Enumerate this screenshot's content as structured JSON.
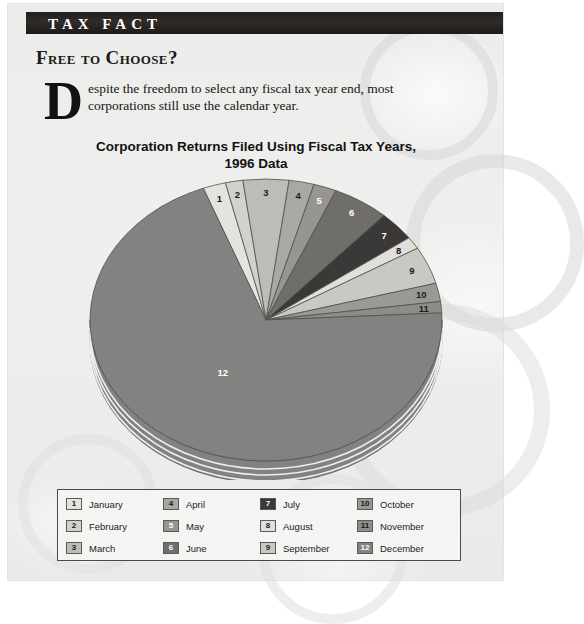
{
  "banner": {
    "title": "TAX FACT"
  },
  "article": {
    "headline": "Free to Choose?",
    "dropcap": "D",
    "body": "espite the freedom to select any fiscal tax year end, most corporations still use the calendar year."
  },
  "chart_data": {
    "type": "pie",
    "title": "Corporation Returns Filed Using Fiscal Tax Years, 1996 Data",
    "title_line1": "Corporation Returns Filed Using Fiscal Tax Years,",
    "title_line2": "1996 Data",
    "xlabel": "",
    "ylabel": "",
    "legend_position": "bottom",
    "grid": false,
    "categories": [
      "January",
      "February",
      "March",
      "April",
      "May",
      "June",
      "July",
      "August",
      "September",
      "October",
      "November",
      "December"
    ],
    "slice_numbers": [
      "1",
      "2",
      "3",
      "4",
      "5",
      "6",
      "7",
      "8",
      "9",
      "10",
      "11",
      "12"
    ],
    "values": [
      2.1,
      1.6,
      4.2,
      2.3,
      2.1,
      5.2,
      3.4,
      1.4,
      4.3,
      2.1,
      1.3,
      70.0
    ],
    "colors": [
      "#e4e3df",
      "#d2d1cc",
      "#bdbcb7",
      "#a9a8a3",
      "#969590",
      "#6f6e6a",
      "#3a3937",
      "#e0dfdb",
      "#c9c8c3",
      "#9a9994",
      "#8d8c87",
      "#828281"
    ],
    "label_colors": [
      "#1a1a1a",
      "#1a1a1a",
      "#1a1a1a",
      "#1a1a1a",
      "#ffffff",
      "#ffffff",
      "#ffffff",
      "#1a1a1a",
      "#1a1a1a",
      "#1a1a1a",
      "#1a1a1a",
      "#ffffff"
    ]
  },
  "legend": {
    "items": [
      {
        "num": "1",
        "label": "January",
        "color": "#e4e3df",
        "num_color": "#1a1a1a"
      },
      {
        "num": "2",
        "label": "February",
        "color": "#d2d1cc",
        "num_color": "#1a1a1a"
      },
      {
        "num": "3",
        "label": "March",
        "color": "#bdbcb7",
        "num_color": "#1a1a1a"
      },
      {
        "num": "4",
        "label": "April",
        "color": "#a9a8a3",
        "num_color": "#1a1a1a"
      },
      {
        "num": "5",
        "label": "May",
        "color": "#969590",
        "num_color": "#ffffff"
      },
      {
        "num": "6",
        "label": "June",
        "color": "#6f6e6a",
        "num_color": "#ffffff"
      },
      {
        "num": "7",
        "label": "July",
        "color": "#3a3937",
        "num_color": "#ffffff"
      },
      {
        "num": "8",
        "label": "August",
        "color": "#e0dfdb",
        "num_color": "#1a1a1a"
      },
      {
        "num": "9",
        "label": "September",
        "color": "#c9c8c3",
        "num_color": "#1a1a1a"
      },
      {
        "num": "10",
        "label": "October",
        "color": "#9a9994",
        "num_color": "#1a1a1a"
      },
      {
        "num": "11",
        "label": "November",
        "color": "#8d8c87",
        "num_color": "#1a1a1a"
      },
      {
        "num": "12",
        "label": "December",
        "color": "#828281",
        "num_color": "#ffffff"
      }
    ],
    "column_order": [
      0,
      3,
      6,
      9,
      1,
      4,
      7,
      10,
      2,
      5,
      8,
      11
    ]
  }
}
